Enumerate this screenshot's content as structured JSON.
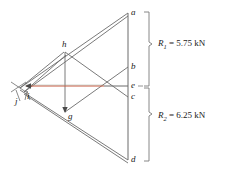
{
  "figure": {
    "colors": {
      "line": "#6b6b6b",
      "line_dark": "#4a4a4a",
      "highlight": "#c8563c",
      "bracket": "#7a7a7a",
      "text": "#1a1a1a",
      "background": "#ffffff"
    },
    "nodes": [
      {
        "id": "a",
        "label": "a",
        "x": 131,
        "y": 13
      },
      {
        "id": "b",
        "label": "b",
        "x": 131,
        "y": 67
      },
      {
        "id": "e",
        "label": "e",
        "x": 131,
        "y": 86
      },
      {
        "id": "c",
        "label": "c",
        "x": 131,
        "y": 97
      },
      {
        "id": "d",
        "label": "d",
        "x": 131,
        "y": 160
      },
      {
        "id": "h",
        "label": "h",
        "x": 64,
        "y": 45
      },
      {
        "id": "g",
        "label": "g",
        "x": 68,
        "y": 115
      },
      {
        "id": "i",
        "label": "i",
        "x": 27,
        "y": 89
      },
      {
        "id": "j",
        "label": "j",
        "x": 16,
        "y": 94
      }
    ],
    "reactions": [
      {
        "id": "R1",
        "symbol": "R",
        "subscript": "1",
        "value": "= 5.75 kN",
        "full_text": "R1 = 5.75 kN",
        "magnitude": 5.75,
        "unit": "kN",
        "span_from": "a",
        "span_to": "e"
      },
      {
        "id": "R2",
        "symbol": "R",
        "subscript": "2",
        "value": "= 6.25 kN",
        "full_text": "R2 = 6.25 kN",
        "magnitude": 6.25,
        "unit": "kN",
        "span_from": "e",
        "span_to": "d"
      }
    ]
  }
}
